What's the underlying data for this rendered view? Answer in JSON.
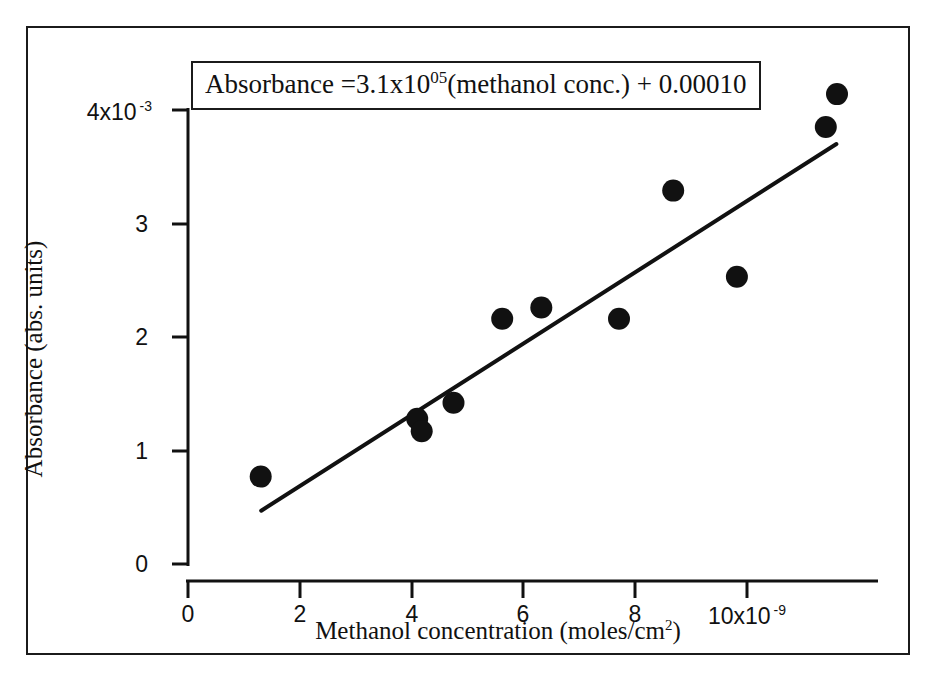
{
  "figure": {
    "frame_color": "#1b1b1b",
    "background": "#ffffff",
    "marker_color": "#111111",
    "line_color": "#111111"
  },
  "annotation": {
    "equation_prefix": "Absorbance =3.1x10",
    "equation_exponent": "05",
    "equation_suffix": "(methanol conc.) + 0.00010"
  },
  "axes": {
    "y_title": "Absorbance (abs. units)",
    "x_title_prefix": "Methanol concentration (moles/cm",
    "x_title_sup": "2",
    "x_title_suffix": ")",
    "y_ticks": [
      {
        "label": "0",
        "exp": "",
        "value": 0
      },
      {
        "label": "1",
        "exp": "",
        "value": 1
      },
      {
        "label": "2",
        "exp": "",
        "value": 2
      },
      {
        "label": "3",
        "exp": "",
        "value": 3
      },
      {
        "label": "4x10",
        "exp": "-3",
        "value": 4
      }
    ],
    "x_ticks": [
      {
        "label": "0",
        "exp": "",
        "value": 0
      },
      {
        "label": "2",
        "exp": "",
        "value": 2
      },
      {
        "label": "4",
        "exp": "",
        "value": 4
      },
      {
        "label": "6",
        "exp": "",
        "value": 6
      },
      {
        "label": "8",
        "exp": "",
        "value": 8
      },
      {
        "label": "10x10",
        "exp": "-9",
        "value": 10
      }
    ]
  },
  "chart_data": {
    "type": "scatter",
    "title": "",
    "subtitle": "",
    "xlabel": "Methanol concentration (moles/cm2)",
    "ylabel": "Absorbance (abs. units)",
    "x_unit_exponent": -9,
    "y_unit_exponent": -3,
    "xlim": [
      0,
      12.3
    ],
    "ylim": [
      0,
      4.35
    ],
    "xticks": [
      0,
      2,
      4,
      6,
      8,
      10
    ],
    "yticks": [
      0,
      1,
      2,
      3,
      4
    ],
    "grid": false,
    "legend": "none",
    "annotations": [
      "Absorbance =3.1x10^05(methanol conc.) + 0.00010"
    ],
    "series": [
      {
        "name": "Measured absorbance",
        "marker": "filled-circle",
        "points": [
          {
            "x": 1.3,
            "y": 0.77
          },
          {
            "x": 4.1,
            "y": 1.28
          },
          {
            "x": 4.18,
            "y": 1.17
          },
          {
            "x": 4.75,
            "y": 1.42
          },
          {
            "x": 5.62,
            "y": 2.16
          },
          {
            "x": 6.32,
            "y": 2.26
          },
          {
            "x": 7.71,
            "y": 2.16
          },
          {
            "x": 8.68,
            "y": 3.29
          },
          {
            "x": 9.82,
            "y": 2.53
          },
          {
            "x": 11.41,
            "y": 3.85
          },
          {
            "x": 11.61,
            "y": 4.14
          }
        ]
      },
      {
        "name": "Linear fit",
        "type": "line",
        "slope": 0.31,
        "intercept": 0.1,
        "x_start": 1.31,
        "y_start": 0.47,
        "x_end": 11.6,
        "y_end": 3.7
      }
    ]
  }
}
